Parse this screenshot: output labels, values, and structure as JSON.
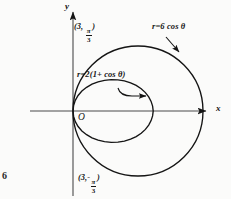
{
  "figure": {
    "background_color": "#fbfbfa",
    "ink_color": "#141414",
    "caption_fragment": "6"
  },
  "axes": {
    "x_label": "x",
    "y_label": "y",
    "origin_label": "O",
    "origin_px": [
      73,
      111
    ],
    "x_axis_from_px": [
      30,
      111
    ],
    "x_axis_to_px": [
      212,
      111
    ],
    "y_axis_from_px": [
      73,
      196
    ],
    "y_axis_to_px": [
      73,
      8
    ]
  },
  "curves": [
    {
      "name": "circle",
      "equation_label": "r=6 cos θ",
      "label_pos_px": [
        152,
        26
      ],
      "leader_from_px": [
        168,
        38
      ],
      "leader_to_px": [
        180,
        52
      ],
      "polar": "r = 6 cos(theta)",
      "center_px": [
        138,
        111
      ],
      "radius_px": 65,
      "x_max_px": 203
    },
    {
      "name": "cardioid",
      "equation_label": "r=2(1+ cos θ)",
      "label_pos_px": [
        77,
        74
      ],
      "arrow_from_px": [
        118,
        90
      ],
      "arrow_to_px": [
        147,
        90
      ],
      "polar": "r = 2(1 + cos(theta))",
      "cusp_px": [
        73,
        111
      ],
      "x_max_px": 155,
      "scale_px_per_unit": 20.5
    }
  ],
  "points": [
    {
      "name": "upper-intersection",
      "label_r": "3",
      "label_theta_num": "π",
      "label_theta_den": "3",
      "label_theta_sign": "",
      "label_pos_px": [
        74,
        25
      ],
      "point_px": [
        104,
        47
      ]
    },
    {
      "name": "lower-intersection",
      "label_r": "3",
      "label_theta_num": "π",
      "label_theta_den": "3",
      "label_theta_sign": "-",
      "label_pos_px": [
        78,
        176
      ],
      "point_px": [
        104,
        163
      ]
    }
  ]
}
